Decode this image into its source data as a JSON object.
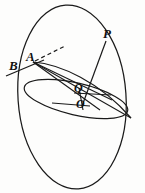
{
  "figure": {
    "background_color": "#fdfdfc",
    "stroke_color": "#1a1a1a",
    "labels": {
      "A": "A",
      "B": "B",
      "P": "P",
      "Q": "Q",
      "O": "O"
    },
    "points": [
      {
        "name": "A",
        "x": 33,
        "y": 62,
        "label": "A"
      },
      {
        "name": "B",
        "x": 16,
        "y": 70,
        "label": "B"
      },
      {
        "name": "P",
        "x": 110,
        "y": 32,
        "label": "P"
      },
      {
        "name": "Q",
        "x": 80,
        "y": 92,
        "label": "Q"
      },
      {
        "name": "O",
        "x": 82,
        "y": 106,
        "label": "O"
      }
    ],
    "shapes": {
      "outer_ellipse": {
        "name": "sphere-outline",
        "cx": 72,
        "cy": 97,
        "rx": 54,
        "ry": 92,
        "rotation": -4
      },
      "equator_ellipse": {
        "name": "great-circle-equator",
        "cx": 76,
        "cy": 98,
        "rx": 52,
        "ry": 15,
        "rotation": 14
      },
      "tilted_ellipse": {
        "name": "tilted-great-circle",
        "cx": 76,
        "cy": 92,
        "rx": 50,
        "ry": 12,
        "rotation": 6
      }
    },
    "segments": [
      {
        "name": "line-A-to-B-extended",
        "from": "A",
        "to": "B",
        "style": "solid"
      },
      {
        "name": "tangent-ray-from-A",
        "from": "A",
        "to": "dashed-end",
        "style": "dashed"
      },
      {
        "name": "chord-A-to-right",
        "from": "A",
        "to": "right-vertex",
        "style": "solid"
      },
      {
        "name": "chord-A-to-O",
        "from": "A",
        "to": "O",
        "style": "solid"
      },
      {
        "name": "chord-A-to-Q",
        "from": "A",
        "to": "Q",
        "style": "solid"
      },
      {
        "name": "segment-P-to-O",
        "from": "P",
        "to": "O",
        "style": "solid"
      },
      {
        "name": "segment-Q-horizontal",
        "from": "Q",
        "to": "right",
        "style": "solid"
      },
      {
        "name": "segment-O-horizontal",
        "from": "O",
        "to": "left",
        "style": "solid"
      }
    ]
  }
}
